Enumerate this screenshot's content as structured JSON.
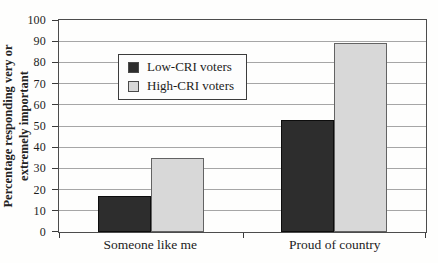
{
  "chart_data": {
    "type": "bar",
    "categories": [
      "Someone like me",
      "Proud of country"
    ],
    "series": [
      {
        "name": "Low-CRI voters",
        "color": "#2d2d2d",
        "border_color": "#0d0d0d",
        "values": [
          17,
          53
        ]
      },
      {
        "name": "High-CRI voters",
        "color": "#d8d8d8",
        "border_color": "#636363",
        "values": [
          35,
          89
        ]
      }
    ],
    "title": "",
    "xlabel": "",
    "ylabel": "Percentage responding very or extremely important",
    "ylabel_lines": [
      "Percentage responding very or",
      "extremely important"
    ],
    "ylim": [
      0,
      100
    ],
    "yticks": [
      0,
      10,
      20,
      30,
      40,
      50,
      60,
      70,
      80,
      90,
      100
    ],
    "grid": true,
    "legend_position": "upper-left-inside"
  },
  "colors": {
    "gridline": "#a6a6a6",
    "axis": "#4c4c4c",
    "background": "#fefefd",
    "text": "#1c1c1c"
  }
}
